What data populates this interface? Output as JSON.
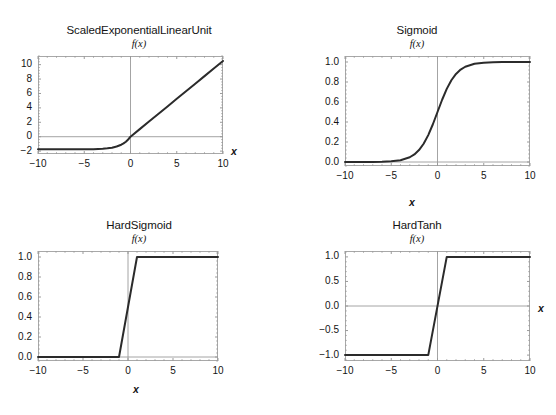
{
  "figure": {
    "background": "#ffffff",
    "curve_color": "#2b2b2b",
    "frame_color": "#a8a8a8",
    "zero_line_color": "#9a9a9a",
    "header_fragment_left": "",
    "header_fragment_right": ""
  },
  "chart_data": [
    {
      "type": "line",
      "title": "ScaledExponentialLinearUnit",
      "subtitle": "f(x)",
      "xlabel": "x",
      "ylabel": "",
      "xlim": [
        -10,
        10
      ],
      "ylim": [
        -2.4,
        11.2
      ],
      "grid": false,
      "legend": "none",
      "xticks": [
        -10,
        -5,
        0,
        5,
        10
      ],
      "xticklabels": [
        "-10",
        "-5",
        "0",
        "5",
        "10"
      ],
      "yticks": [
        -2,
        0,
        2,
        4,
        6,
        8,
        10
      ],
      "yticklabels": [
        "-2",
        "0",
        "2",
        "4",
        "6",
        "8",
        "10"
      ],
      "x": [
        -10,
        -9,
        -8,
        -7,
        -6,
        -5,
        -4,
        -3.5,
        -3,
        -2.5,
        -2,
        -1.5,
        -1,
        -0.75,
        -0.5,
        -0.25,
        0,
        1,
        2,
        3,
        4,
        5,
        6,
        7,
        8,
        9,
        10
      ],
      "y": [
        -1.758,
        -1.758,
        -1.757,
        -1.756,
        -1.754,
        -1.746,
        -1.727,
        -1.706,
        -1.671,
        -1.614,
        -1.52,
        -1.366,
        -1.111,
        -0.928,
        -0.692,
        -0.389,
        0,
        1.051,
        2.101,
        3.152,
        4.203,
        5.253,
        6.304,
        7.355,
        8.405,
        9.456,
        10.507
      ],
      "annotations": []
    },
    {
      "type": "line",
      "title": "Sigmoid",
      "subtitle": "f(x)",
      "xlabel": "x",
      "ylabel": "",
      "xlim": [
        -10,
        10
      ],
      "ylim": [
        -0.04,
        1.06
      ],
      "grid": false,
      "legend": "none",
      "xticks": [
        -10,
        -5,
        0,
        5,
        10
      ],
      "xticklabels": [
        "-10",
        "-5",
        "0",
        "5",
        "10"
      ],
      "yticks": [
        0.0,
        0.2,
        0.4,
        0.6,
        0.8,
        1.0
      ],
      "yticklabels": [
        "0.0",
        "0.2",
        "0.4",
        "0.6",
        "0.8",
        "1.0"
      ],
      "x": [
        -10,
        -9,
        -8,
        -7,
        -6,
        -5,
        -4,
        -3,
        -2.5,
        -2,
        -1.5,
        -1,
        -0.5,
        0,
        0.5,
        1,
        1.5,
        2,
        2.5,
        3,
        4,
        5,
        6,
        7,
        8,
        9,
        10
      ],
      "y": [
        0.0,
        0.0001,
        0.0003,
        0.0009,
        0.0025,
        0.0067,
        0.018,
        0.0474,
        0.0759,
        0.1192,
        0.1824,
        0.2689,
        0.3775,
        0.5,
        0.6225,
        0.7311,
        0.8176,
        0.8808,
        0.9241,
        0.9526,
        0.982,
        0.9933,
        0.9975,
        0.9991,
        0.9997,
        0.9999,
        1.0
      ],
      "annotations": []
    },
    {
      "type": "line",
      "title": "HardSigmoid",
      "subtitle": "f(x)",
      "xlabel": "x",
      "ylabel": "",
      "xlim": [
        -10,
        10
      ],
      "ylim": [
        -0.04,
        1.06
      ],
      "grid": false,
      "legend": "none",
      "xticks": [
        -10,
        -5,
        0,
        5,
        10
      ],
      "xticklabels": [
        "-10",
        "-5",
        "0",
        "5",
        "10"
      ],
      "yticks": [
        0.0,
        0.2,
        0.4,
        0.6,
        0.8,
        1.0
      ],
      "yticklabels": [
        "0.0",
        "0.2",
        "0.4",
        "0.6",
        "0.8",
        "1.0"
      ],
      "x": [
        -10,
        -1,
        1,
        10
      ],
      "y": [
        0.0,
        0.0,
        1.0,
        1.0
      ],
      "annotations": []
    },
    {
      "type": "line",
      "title": "HardTanh",
      "subtitle": "f(x)",
      "xlabel": "x",
      "ylabel": "",
      "xlim": [
        -10,
        10
      ],
      "ylim": [
        -1.12,
        1.12
      ],
      "grid": false,
      "legend": "none",
      "xticks": [
        -10,
        -5,
        0,
        5,
        10
      ],
      "xticklabels": [
        "-10",
        "-5",
        "0",
        "5",
        "10"
      ],
      "yticks": [
        -1.0,
        -0.5,
        0.0,
        0.5,
        1.0
      ],
      "yticklabels": [
        "-1.0",
        "-0.5",
        "0.0",
        "0.5",
        "1.0"
      ],
      "x": [
        -10,
        -1,
        1,
        10
      ],
      "y": [
        -1.0,
        -1.0,
        1.0,
        1.0
      ],
      "annotations": []
    }
  ]
}
